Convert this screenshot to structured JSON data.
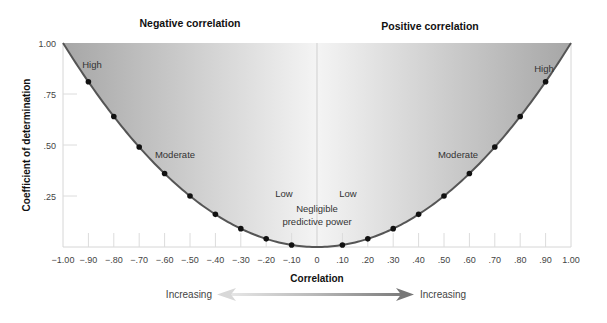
{
  "chart_data": {
    "type": "area",
    "title_left": "Negative correlation",
    "title_right": "Positive correlation",
    "xlabel": "Correlation",
    "ylabel": "Coefficient of determination",
    "xlim": [
      -1.0,
      1.0
    ],
    "ylim": [
      0,
      1.0
    ],
    "x_ticks": [
      "-1.00",
      "-.90",
      "-.80",
      "-.70",
      "-.60",
      "-.50",
      "-.40",
      "-.30",
      "-.20",
      "-.10",
      "0",
      ".10",
      ".20",
      ".30",
      ".40",
      ".50",
      ".60",
      ".70",
      ".80",
      ".90",
      "1.00"
    ],
    "x_tick_values": [
      -1.0,
      -0.9,
      -0.8,
      -0.7,
      -0.6,
      -0.5,
      -0.4,
      -0.3,
      -0.2,
      -0.1,
      0,
      0.1,
      0.2,
      0.3,
      0.4,
      0.5,
      0.6,
      0.7,
      0.8,
      0.9,
      1.0
    ],
    "y_ticks": [
      ".25",
      ".50",
      ".75",
      "1.00"
    ],
    "y_tick_values": [
      0.25,
      0.5,
      0.75,
      1.0
    ],
    "curve": "y = r^2",
    "points": {
      "x": [
        -0.9,
        -0.8,
        -0.7,
        -0.6,
        -0.5,
        -0.4,
        -0.3,
        -0.2,
        -0.1,
        0.1,
        0.2,
        0.3,
        0.4,
        0.5,
        0.6,
        0.7,
        0.8,
        0.9
      ],
      "y": [
        0.81,
        0.64,
        0.49,
        0.36,
        0.25,
        0.16,
        0.09,
        0.04,
        0.01,
        0.01,
        0.04,
        0.09,
        0.16,
        0.25,
        0.36,
        0.49,
        0.64,
        0.81
      ]
    },
    "annotations": [
      {
        "text": "High",
        "x": -0.88,
        "y": 0.9
      },
      {
        "text": "Moderate",
        "x": -0.55,
        "y": 0.52
      },
      {
        "text": "Low",
        "x": -0.14,
        "y": 0.2
      },
      {
        "text": "Negligible",
        "x": 0.0,
        "y": 0.14
      },
      {
        "text": "predictive power",
        "x": 0.0,
        "y": 0.08
      },
      {
        "text": "Low",
        "x": 0.13,
        "y": 0.2
      },
      {
        "text": "Moderate",
        "x": 0.5,
        "y": 0.52
      },
      {
        "text": "High",
        "x": 0.88,
        "y": 0.9
      }
    ],
    "arrow": {
      "left_label": "Increasing",
      "right_label": "Increasing"
    },
    "grid": false,
    "legend": null,
    "colors": {
      "fill_edge": "#a9a9a9",
      "fill_center": "#f2f2f2",
      "curve": "#555555",
      "dot": "#111111",
      "axis": "#d6d6d6"
    }
  }
}
